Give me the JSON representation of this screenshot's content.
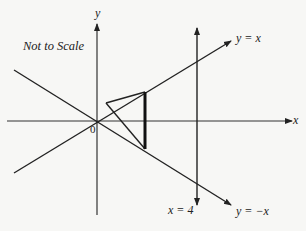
{
  "diagram": {
    "note": "Not to Scale",
    "axes": {
      "x_label": "x",
      "y_label": "y",
      "origin_label": "0"
    },
    "lines": [
      {
        "id": "line-y-equals-x",
        "label": "y = x"
      },
      {
        "id": "line-y-equals-neg-x",
        "label": "y = −x"
      },
      {
        "id": "line-x-equals-4",
        "label": "x = 4"
      }
    ],
    "triangle": {
      "description": "Triangle with a vertex near the origin region, thick vertical side between y = x and y = −x",
      "vertices_px": [
        [
          106,
          103
        ],
        [
          145,
          92
        ],
        [
          145,
          149
        ]
      ]
    },
    "colors": {
      "ink": "#222222",
      "background": "#f7f7f5"
    }
  }
}
